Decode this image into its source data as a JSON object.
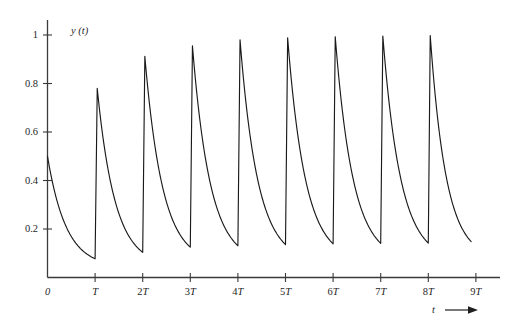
{
  "chart_data": {
    "type": "line",
    "title": "",
    "subtitle": "",
    "xlabel": "t",
    "ylabel": "y (t)",
    "xlabel_arrow": "⟶",
    "grid": false,
    "legend": null,
    "xlim": [
      0,
      9.6
    ],
    "ylim": [
      0,
      1.06
    ],
    "x_tick_labels": [
      "0",
      "T",
      "2T",
      "3T",
      "4T",
      "5T",
      "6T",
      "7T",
      "8T",
      "9T"
    ],
    "x_tick_values": [
      0,
      1,
      2,
      3,
      4,
      5,
      6,
      7,
      8,
      9
    ],
    "y_tick_labels": [
      "0.2",
      "0.4",
      "0.6",
      "0.8",
      "1"
    ],
    "y_tick_values": [
      0.2,
      0.4,
      0.6,
      0.8,
      1.0
    ],
    "line_color": "#1a1a1a",
    "axis_color": "#3a3a3a",
    "series": [
      {
        "name": "y(t)",
        "cycles": [
          {
            "index": 0,
            "t_start": 0.0,
            "t_end": 1.0,
            "start_value": 0.5,
            "peak_value": 0.5,
            "end_value": 0.077
          },
          {
            "index": 1,
            "t_start": 1.0,
            "t_end": 2.0,
            "start_value": 0.077,
            "peak_value": 0.78,
            "end_value": 0.104
          },
          {
            "index": 2,
            "t_start": 2.0,
            "t_end": 3.0,
            "start_value": 0.104,
            "peak_value": 0.912,
            "end_value": 0.125
          },
          {
            "index": 3,
            "t_start": 3.0,
            "t_end": 4.0,
            "start_value": 0.125,
            "peak_value": 0.955,
            "end_value": 0.131
          },
          {
            "index": 4,
            "t_start": 4.0,
            "t_end": 5.0,
            "start_value": 0.131,
            "peak_value": 0.98,
            "end_value": 0.136
          },
          {
            "index": 5,
            "t_start": 5.0,
            "t_end": 6.0,
            "start_value": 0.136,
            "peak_value": 0.988,
            "end_value": 0.139
          },
          {
            "index": 6,
            "t_start": 6.0,
            "t_end": 7.0,
            "start_value": 0.139,
            "peak_value": 0.993,
            "end_value": 0.141
          },
          {
            "index": 7,
            "t_start": 7.0,
            "t_end": 8.0,
            "start_value": 0.141,
            "peak_value": 0.996,
            "end_value": 0.142
          },
          {
            "index": 8,
            "t_start": 8.0,
            "t_end": 8.9,
            "start_value": 0.142,
            "peak_value": 0.998,
            "end_value": 0.148
          }
        ],
        "decay_rate_per_period": 2.56,
        "rise_fraction_of_period": 0.045
      }
    ]
  }
}
